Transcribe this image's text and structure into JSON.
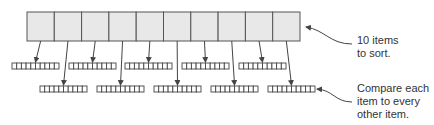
{
  "diagram": {
    "top_array": {
      "count": 10,
      "x": 27,
      "y": 12,
      "cell_width": 27.3,
      "height": 29,
      "fill": "#e8e8e8",
      "stroke": "#555555"
    },
    "sub_arrays": {
      "cells": 10,
      "cell_width": 4.7,
      "height": 6,
      "fill": "#ffffff",
      "stroke": "#444444",
      "row1": {
        "y": 63,
        "xs": [
          12,
          69,
          125,
          182,
          239
        ]
      },
      "row2": {
        "y": 86,
        "xs": [
          40,
          97,
          154,
          211,
          268
        ]
      }
    },
    "annotations": [
      {
        "id": "items-to-sort",
        "text_lines": [
          "10 items",
          "to sort."
        ]
      },
      {
        "id": "compare-each",
        "text_lines": [
          "Compare each",
          "item to every",
          "other item."
        ]
      }
    ],
    "colors": {
      "line": "#444444",
      "text": "#333333"
    }
  }
}
